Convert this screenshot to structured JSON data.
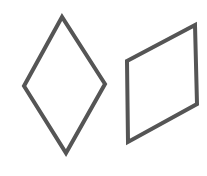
{
  "diagram": {
    "background": "#ffffff",
    "stroke_color": "#555555",
    "stroke_width": 4,
    "shapes": [
      {
        "name": "rhombus",
        "type": "quadrilateral",
        "points": "62,17 24,86 66,153 105,84"
      },
      {
        "name": "parallelogram",
        "type": "quadrilateral",
        "points": "127,61 195,25 197,104 128,142"
      }
    ]
  }
}
